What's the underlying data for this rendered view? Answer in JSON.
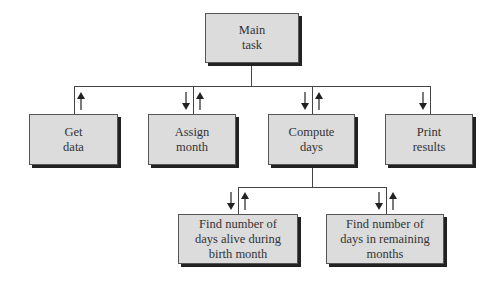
{
  "diagram": {
    "type": "structure-chart",
    "nodes": [
      {
        "id": "main",
        "label": "Main\ntask",
        "level": 0
      },
      {
        "id": "get",
        "label": "Get\ndata",
        "level": 1,
        "parent": "main",
        "arrows": [
          "up"
        ]
      },
      {
        "id": "assign",
        "label": "Assign\nmonth",
        "level": 1,
        "parent": "main",
        "arrows": [
          "down",
          "up"
        ]
      },
      {
        "id": "compute",
        "label": "Compute\ndays",
        "level": 1,
        "parent": "main",
        "arrows": [
          "down",
          "up"
        ]
      },
      {
        "id": "print",
        "label": "Print\nresults",
        "level": 1,
        "parent": "main",
        "arrows": [
          "down"
        ]
      },
      {
        "id": "birth",
        "label": "Find number of\ndays alive during\nbirth month",
        "level": 2,
        "parent": "compute",
        "arrows": [
          "down",
          "up"
        ]
      },
      {
        "id": "remaining",
        "label": "Find number of\ndays in remaining\nmonths",
        "level": 2,
        "parent": "compute",
        "arrows": [
          "down",
          "up"
        ]
      }
    ]
  }
}
